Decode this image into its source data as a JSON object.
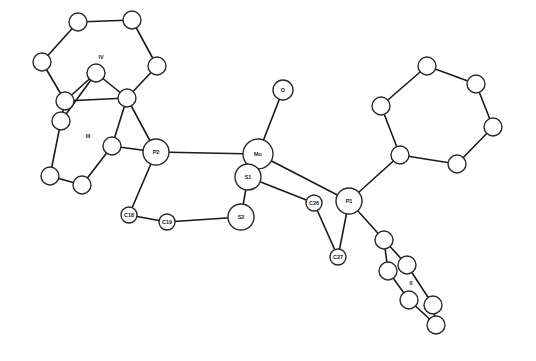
{
  "atoms": [
    {
      "id": "O",
      "label": "O",
      "kind": "labeled"
    },
    {
      "id": "Mo",
      "label": "Mo",
      "kind": "labeled"
    },
    {
      "id": "S1",
      "label": "S1",
      "kind": "labeled"
    },
    {
      "id": "S2",
      "label": "S2",
      "kind": "labeled"
    },
    {
      "id": "P1",
      "label": "P1",
      "kind": "labeled"
    },
    {
      "id": "P2",
      "label": "P2",
      "kind": "labeled"
    },
    {
      "id": "C18",
      "label": "C18",
      "kind": "labeled"
    },
    {
      "id": "C19",
      "label": "C19",
      "kind": "labeled"
    },
    {
      "id": "C26",
      "label": "C26",
      "kind": "labeled"
    },
    {
      "id": "C27",
      "label": "C27",
      "kind": "labeled"
    },
    {
      "id": "a1",
      "label": "",
      "kind": "carbon"
    },
    {
      "id": "a2",
      "label": "",
      "kind": "carbon"
    },
    {
      "id": "a3",
      "label": "",
      "kind": "carbon"
    },
    {
      "id": "a4",
      "label": "",
      "kind": "carbon"
    },
    {
      "id": "a5",
      "label": "",
      "kind": "carbon"
    },
    {
      "id": "a6",
      "label": "",
      "kind": "carbon"
    },
    {
      "id": "b1",
      "label": "",
      "kind": "carbon"
    },
    {
      "id": "b2",
      "label": "",
      "kind": "carbon"
    },
    {
      "id": "c1",
      "label": "",
      "kind": "carbon"
    },
    {
      "id": "c2",
      "label": "",
      "kind": "carbon"
    },
    {
      "id": "c3",
      "label": "",
      "kind": "carbon"
    },
    {
      "id": "c4",
      "label": "",
      "kind": "carbon"
    },
    {
      "id": "d1",
      "label": "",
      "kind": "carbon"
    },
    {
      "id": "d2",
      "label": "",
      "kind": "carbon"
    },
    {
      "id": "d3",
      "label": "",
      "kind": "carbon"
    },
    {
      "id": "d4",
      "label": "",
      "kind": "carbon"
    },
    {
      "id": "d5",
      "label": "",
      "kind": "carbon"
    },
    {
      "id": "d6",
      "label": "",
      "kind": "carbon"
    },
    {
      "id": "e1",
      "label": "",
      "kind": "carbon"
    },
    {
      "id": "e2",
      "label": "",
      "kind": "carbon"
    },
    {
      "id": "e3",
      "label": "",
      "kind": "carbon"
    },
    {
      "id": "e4",
      "label": "",
      "kind": "carbon"
    },
    {
      "id": "e5",
      "label": "",
      "kind": "carbon"
    },
    {
      "id": "e6",
      "label": "",
      "kind": "carbon"
    }
  ],
  "bonds": [
    [
      "Mo",
      "O"
    ],
    [
      "Mo",
      "S1"
    ],
    [
      "Mo",
      "P2"
    ],
    [
      "Mo",
      "P1"
    ],
    [
      "S1",
      "S2"
    ],
    [
      "S1",
      "C26"
    ],
    [
      "C26",
      "C27"
    ],
    [
      "C27",
      "P1"
    ],
    [
      "S2",
      "C19"
    ],
    [
      "C19",
      "C18"
    ],
    [
      "C18",
      "P2"
    ],
    [
      "P2",
      "b2"
    ],
    [
      "P2",
      "c4"
    ],
    [
      "a1",
      "a2"
    ],
    [
      "a2",
      "a3"
    ],
    [
      "a3",
      "b2"
    ],
    [
      "b2",
      "b1"
    ],
    [
      "b1",
      "a5"
    ],
    [
      "a5",
      "a6"
    ],
    [
      "a6",
      "a1"
    ],
    [
      "a5",
      "b2"
    ],
    [
      "b1",
      "c1"
    ],
    [
      "c1",
      "c2"
    ],
    [
      "c2",
      "c3"
    ],
    [
      "c3",
      "c4"
    ],
    [
      "a5",
      "c1"
    ],
    [
      "c4",
      "b2"
    ],
    [
      "P1",
      "d1"
    ],
    [
      "d1",
      "d2"
    ],
    [
      "d2",
      "d3"
    ],
    [
      "d3",
      "d4"
    ],
    [
      "d4",
      "d5"
    ],
    [
      "d5",
      "d6"
    ],
    [
      "d6",
      "d1"
    ],
    [
      "P1",
      "e1"
    ],
    [
      "e1",
      "e2"
    ],
    [
      "e2",
      "e3"
    ],
    [
      "e3",
      "e4"
    ],
    [
      "e4",
      "e5"
    ],
    [
      "e5",
      "e6"
    ],
    [
      "e6",
      "e1"
    ]
  ],
  "ring_labels": [
    {
      "id": "IV",
      "label": "IV"
    },
    {
      "id": "III",
      "label": "III"
    },
    {
      "id": "II",
      "label": "II"
    }
  ]
}
